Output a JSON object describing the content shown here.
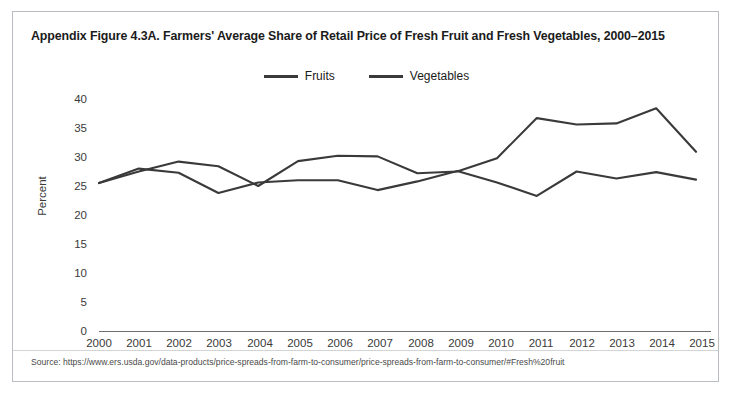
{
  "figure": {
    "title": "Appendix Figure 4.3A. Farmers' Average Share of Retail Price of Fresh Fruit and Fresh Vegetables, 2000–2015",
    "source": "Source: https://www.ers.usda.gov/data-products/price-spreads-from-farm-to-consumer/price-spreads-from-farm-to-consumer/#Fresh%20fruit",
    "line_color": "#3a3a3a",
    "text_color": "#1b1b1b",
    "border_color": "#b9bcc0"
  },
  "legend": {
    "position": "top-center",
    "entries": [
      {
        "label": "Fruits",
        "color": "#3a3a3a"
      },
      {
        "label": "Vegetables",
        "color": "#3a3a3a"
      }
    ]
  },
  "axes": {
    "y_title": "Percent",
    "y_ticks": [
      "40",
      "35",
      "30",
      "25",
      "20",
      "15",
      "10",
      "5",
      "0"
    ],
    "x_ticks": [
      "2000",
      "2001",
      "2002",
      "2003",
      "2004",
      "2005",
      "2006",
      "2007",
      "2008",
      "2009",
      "2010",
      "2011",
      "2012",
      "2013",
      "2014",
      "2015"
    ]
  },
  "chart_data": {
    "type": "line",
    "title": "Appendix Figure 4.3A. Farmers' Average Share of Retail Price of Fresh Fruit and Fresh Vegetables, 2000–2015",
    "xlabel": "",
    "ylabel": "Percent",
    "x": [
      2000,
      2001,
      2002,
      2003,
      2004,
      2005,
      2006,
      2007,
      2008,
      2009,
      2010,
      2011,
      2012,
      2013,
      2014,
      2015
    ],
    "categories": [
      "2000",
      "2001",
      "2002",
      "2003",
      "2004",
      "2005",
      "2006",
      "2007",
      "2008",
      "2009",
      "2010",
      "2011",
      "2012",
      "2013",
      "2014",
      "2015"
    ],
    "series": [
      {
        "name": "Fruits",
        "color": "#3a3a3a",
        "values": [
          25.5,
          28.0,
          27.3,
          23.8,
          25.6,
          26.0,
          26.0,
          24.3,
          25.8,
          27.6,
          25.6,
          23.3,
          27.5,
          26.3,
          27.4,
          26.1
        ]
      },
      {
        "name": "Vegetables",
        "color": "#3a3a3a",
        "values": [
          25.5,
          27.5,
          29.2,
          28.4,
          25.0,
          29.3,
          30.2,
          30.1,
          27.2,
          27.5,
          29.8,
          36.7,
          35.6,
          35.8,
          38.4,
          30.9
        ]
      }
    ],
    "ylim": [
      0,
      40
    ],
    "ytick_step": 5,
    "xlim": [
      2000,
      2015
    ],
    "grid": false,
    "legend": true,
    "legend_position": "top-center"
  }
}
